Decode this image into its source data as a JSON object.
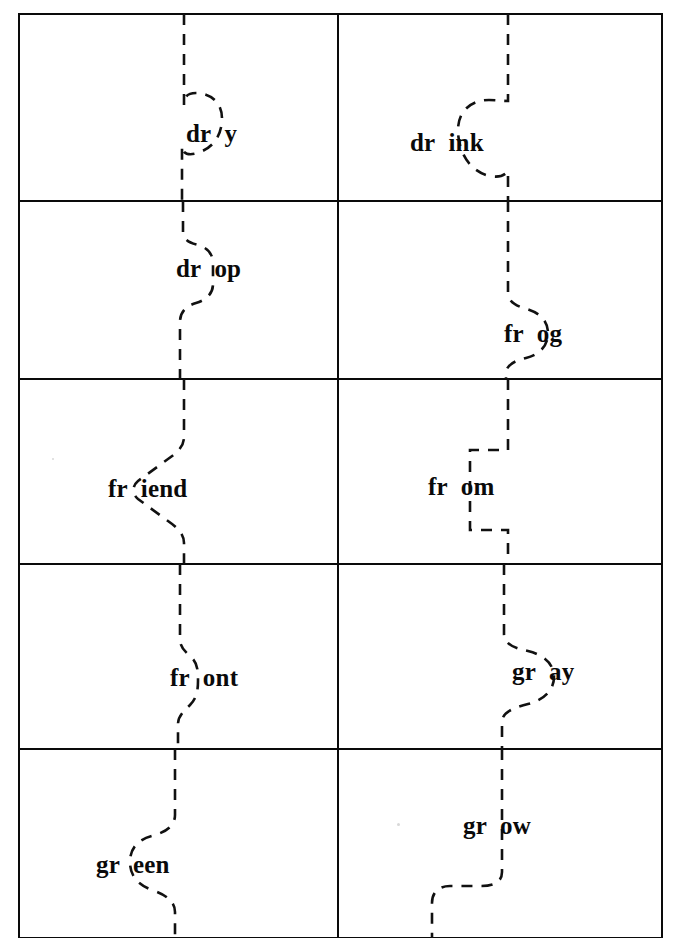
{
  "sheet": {
    "title": "Consonant Blend Word Cut-Apart Cards",
    "width": 680,
    "height": 938,
    "background_color": "#ffffff",
    "grid_line_color": "#0a0a0a",
    "cut_line_color": "#111111",
    "text_color": "#0a0a0a",
    "rows": 5,
    "columns": 2
  },
  "cards": [
    {
      "id": "card-dry",
      "word": "dry",
      "onset": "dr",
      "rime": "y",
      "row": 1,
      "column": 1,
      "cut_style": "round-knob-right"
    },
    {
      "id": "card-drink",
      "word": "drink",
      "onset": "dr",
      "rime": "ink",
      "row": 1,
      "column": 2,
      "cut_style": "round-knob-left"
    },
    {
      "id": "card-drop",
      "word": "drop",
      "onset": "dr",
      "rime": "op",
      "row": 2,
      "column": 1,
      "cut_style": "s-curve-right"
    },
    {
      "id": "card-frog",
      "word": "frog",
      "onset": "fr",
      "rime": "og",
      "row": 2,
      "column": 2,
      "cut_style": "s-curve-right-low"
    },
    {
      "id": "card-friend",
      "word": "friend",
      "onset": "fr",
      "rime": "iend",
      "row": 3,
      "column": 1,
      "cut_style": "chevron-left"
    },
    {
      "id": "card-from",
      "word": "from",
      "onset": "fr",
      "rime": "om",
      "row": 3,
      "column": 2,
      "cut_style": "square-tab-left"
    },
    {
      "id": "card-front",
      "word": "front",
      "onset": "fr",
      "rime": "ont",
      "row": 4,
      "column": 1,
      "cut_style": "small-bulge-right"
    },
    {
      "id": "card-gray",
      "word": "gray",
      "onset": "gr",
      "rime": "ay",
      "row": 4,
      "column": 2,
      "cut_style": "big-bulge-right"
    },
    {
      "id": "card-green",
      "word": "green",
      "onset": "gr",
      "rime": "een",
      "row": 5,
      "column": 1,
      "cut_style": "s-curve-left"
    },
    {
      "id": "card-grow",
      "word": "grow",
      "onset": "gr",
      "rime": "ow",
      "row": 5,
      "column": 2,
      "cut_style": "step-left-low"
    }
  ],
  "layout": {
    "grid": {
      "left": 19,
      "right": 662,
      "mid_x": 338,
      "row_edges": [
        14,
        201,
        379,
        564,
        749,
        938
      ]
    },
    "word_positions": [
      {
        "id": "card-dry",
        "x": 186,
        "y": 137,
        "anchor_left": 186
      },
      {
        "id": "card-drink",
        "x": 410,
        "y": 146,
        "anchor_left": 410
      },
      {
        "id": "card-drop",
        "x": 176,
        "y": 272,
        "anchor_left": 176
      },
      {
        "id": "card-frog",
        "x": 504,
        "y": 337,
        "anchor_left": 504
      },
      {
        "id": "card-friend",
        "x": 108,
        "y": 492,
        "anchor_left": 108
      },
      {
        "id": "card-from",
        "x": 428,
        "y": 490,
        "anchor_left": 428
      },
      {
        "id": "card-front",
        "x": 170,
        "y": 681,
        "anchor_left": 170
      },
      {
        "id": "card-gray",
        "x": 512,
        "y": 675,
        "anchor_left": 512
      },
      {
        "id": "card-green",
        "x": 96,
        "y": 868,
        "anchor_left": 96
      },
      {
        "id": "card-grow",
        "x": 463,
        "y": 829,
        "anchor_left": 463
      }
    ],
    "cut_paths": [
      {
        "id": "cut-dry",
        "d": "M 184 14 L 184 105 C 184 96 188 93 196 93 C 212 93 222 104 222 118 C 222 132 216 146 200 152 C 188 157 182 153 182 146 L 182 201"
      },
      {
        "id": "cut-drink",
        "d": "M 508 14 L 508 101 C 503 101 497 100 489 100 C 470 100 458 112 458 130 C 458 152 470 172 490 176 C 500 178 505 175 508 171 L 508 201"
      },
      {
        "id": "cut-drop",
        "d": "M 183 201 L 183 232 C 183 240 190 243 198 245 C 208 248 213 254 213 264 L 213 284 C 213 294 206 300 196 303 C 186 306 180 312 180 322 L 180 379"
      },
      {
        "id": "cut-frog",
        "d": "M 508 201 L 508 292 C 508 302 516 306 527 309 C 540 313 548 321 548 333 C 548 346 539 355 526 358 C 514 361 506 365 506 374 L 506 379"
      },
      {
        "id": "cut-friend",
        "d": "M 184 379 L 184 437 C 184 446 178 452 168 459 L 138 481 C 132 486 132 494 138 499 L 168 521 C 178 528 184 534 184 543 L 184 564"
      },
      {
        "id": "cut-from",
        "d": "M 508 379 L 508 450 L 470 450 L 470 530 L 508 530 L 508 564"
      },
      {
        "id": "cut-front",
        "d": "M 180 564 L 180 639 C 180 648 186 652 192 658 C 198 664 198 672 198 681 C 198 692 196 699 190 705 C 184 711 178 716 178 724 L 178 749"
      },
      {
        "id": "cut-gray",
        "d": "M 504 564 L 504 634 C 504 644 514 648 528 651 C 544 655 554 664 554 677 C 554 690 544 700 528 704 C 512 708 502 713 502 722 L 502 749"
      },
      {
        "id": "cut-green",
        "d": "M 175 749 L 175 815 C 175 826 166 832 152 836 C 137 840 130 849 130 862 C 130 876 138 885 152 890 C 167 895 175 902 175 912 L 175 938"
      },
      {
        "id": "cut-grow",
        "d": "M 502 749 L 502 872 C 502 882 494 886 481 886 L 450 886 C 438 886 432 893 432 903 L 432 938"
      }
    ]
  }
}
